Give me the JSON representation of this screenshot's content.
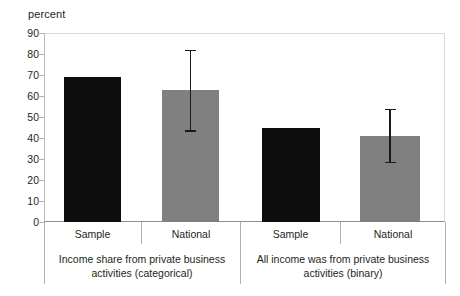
{
  "chart_data": {
    "type": "bar",
    "title": "",
    "subtitle": "",
    "xlabel": "",
    "ylabel": "percent",
    "ylim": [
      0,
      90
    ],
    "ytick_labels": [
      "90",
      "80",
      "70",
      "60",
      "50",
      "40",
      "30",
      "20",
      "10",
      "0"
    ],
    "ytick_values": [
      90,
      80,
      70,
      60,
      50,
      40,
      30,
      20,
      10,
      0
    ],
    "grid": false,
    "legend": null,
    "groups": [
      {
        "caption_line1": "Income share from private business",
        "caption_line2": "activities (categorical)",
        "bars": [
          {
            "label": "Sample",
            "value": 69,
            "color": "#0d0d0d",
            "series": "Sample",
            "error": null
          },
          {
            "label": "National",
            "value": 63,
            "color": "#808080",
            "series": "National",
            "error": {
              "low": 43,
              "high": 82
            }
          }
        ]
      },
      {
        "caption_line1": "All income was from private business",
        "caption_line2": "activities (binary)",
        "bars": [
          {
            "label": "Sample",
            "value": 45,
            "color": "#0d0d0d",
            "series": "Sample",
            "error": null
          },
          {
            "label": "National",
            "value": 41,
            "color": "#808080",
            "series": "National",
            "error": {
              "low": 28,
              "high": 54
            }
          }
        ]
      }
    ],
    "categories": [
      "Sample",
      "National",
      "Sample",
      "National"
    ],
    "values": [
      69,
      63,
      45,
      41
    ],
    "error_low": [
      null,
      43,
      null,
      28
    ],
    "error_high": [
      null,
      82,
      null,
      54
    ]
  },
  "colors": {
    "bar_dark": "#0d0d0d",
    "bar_light": "#808080",
    "axis": "#b0b0b0",
    "baseline": "#8d8d8d",
    "text": "#231f20",
    "error": "#1a1a1a"
  }
}
